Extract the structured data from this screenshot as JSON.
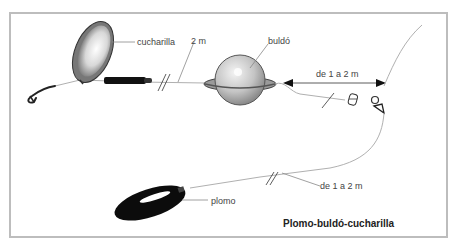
{
  "diagram": {
    "title": "Plomo-buldó-cucharilla",
    "labels": {
      "spoon": "cucharilla",
      "leader_length": "2 m",
      "float": "buldó",
      "float_to_swivel": "de 1 a 2 m",
      "sinker_line": "de 1 a 2 m",
      "sinker": "plomo"
    },
    "components": [
      "hook",
      "spoon",
      "tube",
      "float",
      "swivel",
      "sinker",
      "main-line"
    ],
    "colors": {
      "frame": "#bdbdbd",
      "line": "#b0b0b0",
      "ink": "#111111",
      "float": "#c8c8c8",
      "label": "#444444"
    }
  }
}
